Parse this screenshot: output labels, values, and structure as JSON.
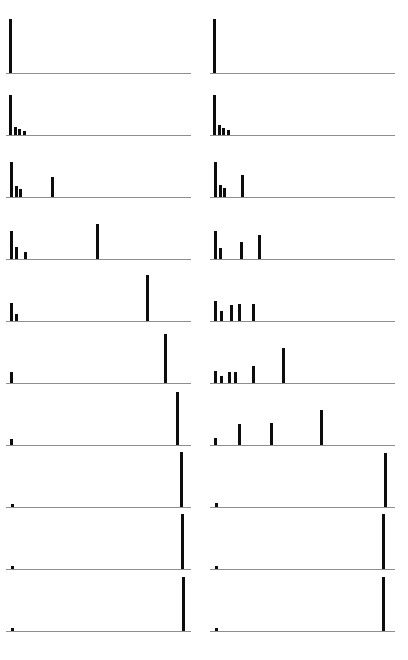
{
  "figure": {
    "title": "",
    "background_color": "#ffffff",
    "axis_color": "#8e8e8e",
    "bar_color": "#0d0d0d",
    "rows": 10,
    "columns": 2,
    "panel_width": 185,
    "panel_height": 56,
    "row_pitch": 62,
    "col_pitch": 204
  },
  "chart_data": {
    "type": "bar",
    "title": "",
    "xlabel": "",
    "ylabel": "",
    "grid": false,
    "legend": "none",
    "xlim": [
      0,
      185
    ],
    "ylim": [
      0,
      1
    ],
    "panels": [
      {
        "id": "r1c1",
        "row": 1,
        "col": 1,
        "x": [
          3
        ],
        "values": [
          0.97
        ]
      },
      {
        "id": "r1c2",
        "row": 1,
        "col": 2,
        "x": [
          3
        ],
        "values": [
          0.97
        ]
      },
      {
        "id": "r2c1",
        "row": 2,
        "col": 1,
        "x": [
          3,
          8,
          12,
          17
        ],
        "values": [
          0.72,
          0.15,
          0.1,
          0.08
        ]
      },
      {
        "id": "r2c2",
        "row": 2,
        "col": 2,
        "x": [
          3,
          8,
          12,
          17
        ],
        "values": [
          0.72,
          0.18,
          0.12,
          0.09
        ]
      },
      {
        "id": "r3c1",
        "row": 3,
        "col": 1,
        "x": [
          4,
          9,
          13,
          45
        ],
        "values": [
          0.62,
          0.2,
          0.14,
          0.36
        ]
      },
      {
        "id": "r3c2",
        "row": 3,
        "col": 2,
        "x": [
          4,
          9,
          13,
          31
        ],
        "values": [
          0.62,
          0.22,
          0.16,
          0.4
        ]
      },
      {
        "id": "r4c1",
        "row": 4,
        "col": 1,
        "x": [
          4,
          9,
          18,
          90
        ],
        "values": [
          0.5,
          0.22,
          0.13,
          0.62
        ]
      },
      {
        "id": "r4c2",
        "row": 4,
        "col": 2,
        "x": [
          4,
          9,
          30,
          48
        ],
        "values": [
          0.5,
          0.2,
          0.3,
          0.42
        ]
      },
      {
        "id": "r5c1",
        "row": 5,
        "col": 1,
        "x": [
          4,
          9,
          140
        ],
        "values": [
          0.33,
          0.12,
          0.83
        ]
      },
      {
        "id": "r5c2",
        "row": 5,
        "col": 2,
        "x": [
          4,
          10,
          20,
          28,
          42
        ],
        "values": [
          0.35,
          0.17,
          0.28,
          0.3,
          0.3
        ]
      },
      {
        "id": "r6c1",
        "row": 6,
        "col": 1,
        "x": [
          4,
          158
        ],
        "values": [
          0.2,
          0.88
        ]
      },
      {
        "id": "r6c2",
        "row": 6,
        "col": 2,
        "x": [
          4,
          10,
          18,
          24,
          42,
          72
        ],
        "values": [
          0.22,
          0.12,
          0.2,
          0.2,
          0.3,
          0.62
        ]
      },
      {
        "id": "r7c1",
        "row": 7,
        "col": 1,
        "x": [
          4,
          170
        ],
        "values": [
          0.1,
          0.94
        ]
      },
      {
        "id": "r7c2",
        "row": 7,
        "col": 2,
        "x": [
          4,
          28,
          60,
          110
        ],
        "values": [
          0.12,
          0.38,
          0.4,
          0.63
        ]
      },
      {
        "id": "r8c1",
        "row": 8,
        "col": 1,
        "x": [
          5,
          174
        ],
        "values": [
          0.06,
          0.98
        ]
      },
      {
        "id": "r8c2",
        "row": 8,
        "col": 2,
        "x": [
          5,
          174
        ],
        "values": [
          0.07,
          0.97
        ]
      },
      {
        "id": "r9c1",
        "row": 9,
        "col": 1,
        "x": [
          5,
          175
        ],
        "values": [
          0.05,
          0.98
        ]
      },
      {
        "id": "r9c2",
        "row": 9,
        "col": 2,
        "x": [
          5,
          172
        ],
        "values": [
          0.06,
          0.99
        ]
      },
      {
        "id": "r10c1",
        "row": 10,
        "col": 1,
        "x": [
          5,
          176
        ],
        "values": [
          0.05,
          0.96
        ]
      },
      {
        "id": "r10c2",
        "row": 10,
        "col": 2,
        "x": [
          5,
          172
        ],
        "values": [
          0.06,
          0.97
        ]
      }
    ]
  }
}
